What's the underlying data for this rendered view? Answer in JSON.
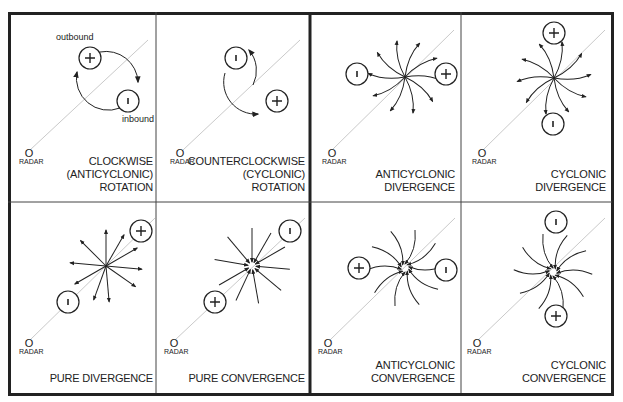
{
  "radar_label": "RADAR",
  "radar_symbol": "O",
  "annotations": {
    "outbound": "outbound",
    "inbound": "inbound"
  },
  "panels": [
    {
      "id": "clockwise",
      "line1": "CLOCKWISE",
      "line2": "(ANTICYCLONIC)",
      "line3": "ROTATION",
      "plus": "+",
      "minus": "-"
    },
    {
      "id": "counterclockwise",
      "line1": "COUNTERCLOCKWISE",
      "line2": "(CYCLONIC)",
      "line3": "ROTATION",
      "plus": "+",
      "minus": "-"
    },
    {
      "id": "anticyclonic-divergence",
      "line1": "ANTICYCLONIC",
      "line2": "DIVERGENCE",
      "plus": "+",
      "minus": "-"
    },
    {
      "id": "cyclonic-divergence",
      "line1": "CYCLONIC",
      "line2": "DIVERGENCE",
      "plus": "+",
      "minus": "-"
    },
    {
      "id": "pure-divergence",
      "line1": "PURE DIVERGENCE",
      "plus": "+",
      "minus": "-"
    },
    {
      "id": "pure-convergence",
      "line1": "PURE CONVERGENCE",
      "plus": "+",
      "minus": "-"
    },
    {
      "id": "anticyclonic-convergence",
      "line1": "ANTICYCLONIC",
      "line2": "CONVERGENCE",
      "plus": "+",
      "minus": "-"
    },
    {
      "id": "cyclonic-convergence",
      "line1": "CYCLONIC",
      "line2": "CONVERGENCE",
      "plus": "+",
      "minus": "-"
    }
  ],
  "colors": {
    "ink": "#222222",
    "radial": "#bbbbbb",
    "background": "#ffffff"
  }
}
